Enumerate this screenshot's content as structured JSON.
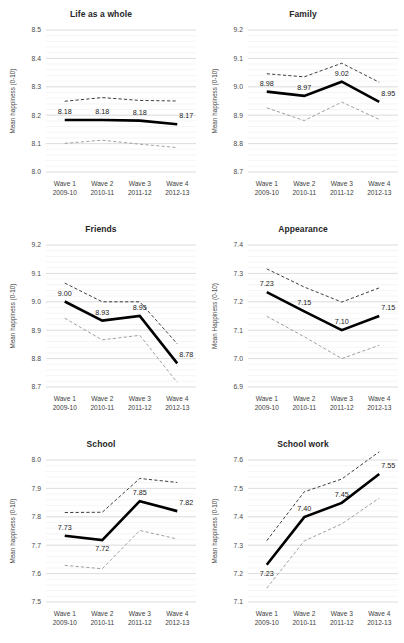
{
  "figure": {
    "axis_y_title": "Mean happiness (0-10)",
    "categories": [
      "Wave 1",
      "Wave 2",
      "Wave 3",
      "Wave 4"
    ],
    "category_years": [
      "2009-10",
      "2010-11",
      "2011-12",
      "2012-13"
    ],
    "colors": {
      "mean_line": "#000000",
      "ci_upper": "#1c1c1c",
      "ci_lower": "#8f8f8f",
      "gridline": "#d4d4d4",
      "background": "#ffffff"
    }
  },
  "chart_data": [
    {
      "type": "line",
      "title": "Life as a whole",
      "xlabel": "",
      "ylabel": "Mean happiness (0-10)",
      "categories": [
        "Wave 1",
        "Wave 2",
        "Wave 3",
        "Wave 4"
      ],
      "category_years": [
        "2009-10",
        "2010-11",
        "2011-12",
        "2012-13"
      ],
      "ylim": [
        8.0,
        8.5
      ],
      "yticks": [
        8.0,
        8.1,
        8.2,
        8.3,
        8.4,
        8.5
      ],
      "ytick_labels": [
        "8.0",
        "8.1",
        "8.2",
        "8.3",
        "8.4",
        "8.5"
      ],
      "minor_tick_step": 0.02,
      "grid": true,
      "legend": "none",
      "series": [
        {
          "name": "Mean",
          "values": [
            8.183,
            8.183,
            8.181,
            8.168
          ],
          "style": "solid-thick"
        },
        {
          "name": "Upper 95% CI",
          "values": [
            8.249,
            8.262,
            8.252,
            8.25
          ],
          "style": "dashed-dark"
        },
        {
          "name": "Lower 95% CI",
          "values": [
            8.101,
            8.112,
            8.098,
            8.086
          ],
          "style": "dashed-light"
        }
      ],
      "data_labels": [
        "8.18",
        "8.18",
        "8.18",
        "8.17"
      ],
      "label_positions": [
        "above",
        "above",
        "above",
        "above-right"
      ]
    },
    {
      "type": "line",
      "title": "Family",
      "xlabel": "",
      "ylabel": "Mean happiness (0-10)",
      "categories": [
        "Wave 1",
        "Wave 2",
        "Wave 3",
        "Wave 4"
      ],
      "category_years": [
        "2009-10",
        "2010-11",
        "2011-12",
        "2012-13"
      ],
      "ylim": [
        8.7,
        9.2
      ],
      "yticks": [
        8.7,
        8.8,
        8.9,
        9.0,
        9.1,
        9.2
      ],
      "ytick_labels": [
        "8.7",
        "8.8",
        "8.9",
        "9.0",
        "9.1",
        "9.2"
      ],
      "minor_tick_step": 0.02,
      "grid": true,
      "legend": "none",
      "series": [
        {
          "name": "Mean",
          "values": [
            8.983,
            8.968,
            9.018,
            8.947
          ],
          "style": "solid-thick"
        },
        {
          "name": "Upper 95% CI",
          "values": [
            9.046,
            9.035,
            9.083,
            9.016
          ],
          "style": "dashed-dark"
        },
        {
          "name": "Lower 95% CI",
          "values": [
            8.926,
            8.881,
            8.946,
            8.885
          ],
          "style": "dashed-light"
        }
      ],
      "data_labels": [
        "8.98",
        "8.97",
        "9.02",
        "8.95"
      ],
      "label_positions": [
        "above",
        "above",
        "above",
        "above-right"
      ]
    },
    {
      "type": "line",
      "title": "Friends",
      "xlabel": "",
      "ylabel": "Mean happiness (0-10)",
      "categories": [
        "Wave 1",
        "Wave 2",
        "Wave 3",
        "Wave 4"
      ],
      "category_years": [
        "2009-10",
        "2010-11",
        "2011-12",
        "2012-13"
      ],
      "ylim": [
        8.7,
        9.2
      ],
      "yticks": [
        8.7,
        8.8,
        8.9,
        9.0,
        9.1,
        9.2
      ],
      "ytick_labels": [
        "8.7",
        "8.8",
        "8.9",
        "9.0",
        "9.1",
        "9.2"
      ],
      "minor_tick_step": 0.02,
      "grid": true,
      "legend": "none",
      "series": [
        {
          "name": "Mean",
          "values": [
            9.001,
            8.934,
            8.95,
            8.783
          ],
          "style": "solid-thick"
        },
        {
          "name": "Upper 95% CI",
          "values": [
            9.066,
            9.0,
            9.0,
            8.852
          ],
          "style": "dashed-dark"
        },
        {
          "name": "Lower 95% CI",
          "values": [
            8.942,
            8.866,
            8.882,
            8.716
          ],
          "style": "dashed-light"
        }
      ],
      "data_labels": [
        "9.00",
        "8.93",
        "8.95",
        "8.78"
      ],
      "label_positions": [
        "above",
        "above",
        "above",
        "above-right"
      ]
    },
    {
      "type": "line",
      "title": "Appearance",
      "xlabel": "",
      "ylabel": "Mean Happiness (0-10)",
      "categories": [
        "Wave 1",
        "Wave 2",
        "Wave 3",
        "Wave 4"
      ],
      "category_years": [
        "2009-10",
        "2010-11",
        "2011-12",
        "2012-13"
      ],
      "ylim": [
        6.9,
        7.4
      ],
      "yticks": [
        6.9,
        7.0,
        7.1,
        7.2,
        7.3,
        7.4
      ],
      "ytick_labels": [
        "6.9",
        "7.0",
        "7.1",
        "7.2",
        "7.3",
        "7.4"
      ],
      "minor_tick_step": 0.02,
      "grid": true,
      "legend": "none",
      "series": [
        {
          "name": "Mean",
          "values": [
            7.234,
            7.166,
            7.1,
            7.15
          ],
          "style": "solid-thick"
        },
        {
          "name": "Upper 95% CI",
          "values": [
            7.316,
            7.252,
            7.199,
            7.249
          ],
          "style": "dashed-dark"
        },
        {
          "name": "Lower 95% CI",
          "values": [
            7.149,
            7.077,
            7.0,
            7.047
          ],
          "style": "dashed-light"
        }
      ],
      "data_labels": [
        "7.23",
        "7.15",
        "7.10",
        "7.15"
      ],
      "label_positions": [
        "above",
        "above",
        "above",
        "above-right"
      ]
    },
    {
      "type": "line",
      "title": "School",
      "xlabel": "",
      "ylabel": "Mean happiness (0-10)",
      "categories": [
        "Wave 1",
        "Wave 2",
        "Wave 3",
        "Wave 4"
      ],
      "category_years": [
        "2009-10",
        "2010-11",
        "2011-12",
        "2012-13"
      ],
      "ylim": [
        7.5,
        8.0
      ],
      "yticks": [
        7.5,
        7.6,
        7.7,
        7.8,
        7.9,
        8.0
      ],
      "ytick_labels": [
        "7.5",
        "7.6",
        "7.7",
        "7.8",
        "7.9",
        "8.0"
      ],
      "minor_tick_step": 0.02,
      "grid": true,
      "legend": "none",
      "series": [
        {
          "name": "Mean",
          "values": [
            7.733,
            7.718,
            7.855,
            7.82
          ],
          "style": "solid-thick"
        },
        {
          "name": "Upper 95% CI",
          "values": [
            7.815,
            7.816,
            7.935,
            7.921
          ],
          "style": "dashed-dark"
        },
        {
          "name": "Lower 95% CI",
          "values": [
            7.629,
            7.617,
            7.752,
            7.722
          ],
          "style": "dashed-light"
        }
      ],
      "data_labels": [
        "7.73",
        "7.72",
        "7.85",
        "7.82"
      ],
      "label_positions": [
        "above",
        "below",
        "above",
        "above-right"
      ]
    },
    {
      "type": "line",
      "title": "School work",
      "xlabel": "",
      "ylabel": "Mean happiness (0-10)",
      "categories": [
        "Wave 1",
        "Wave 2",
        "Wave 3",
        "Wave 4"
      ],
      "category_years": [
        "2009-10",
        "2010-11",
        "2011-12",
        "2012-13"
      ],
      "ylim": [
        7.1,
        7.6
      ],
      "yticks": [
        7.1,
        7.2,
        7.3,
        7.4,
        7.5,
        7.6
      ],
      "ytick_labels": [
        "7.1",
        "7.2",
        "7.3",
        "7.4",
        "7.5",
        "7.6"
      ],
      "minor_tick_step": 0.02,
      "grid": true,
      "legend": "none",
      "series": [
        {
          "name": "Mean",
          "values": [
            7.231,
            7.399,
            7.449,
            7.551
          ],
          "style": "solid-thick"
        },
        {
          "name": "Upper 95% CI",
          "values": [
            7.316,
            7.488,
            7.533,
            7.629
          ],
          "style": "dashed-dark"
        },
        {
          "name": "Lower 95% CI",
          "values": [
            7.149,
            7.315,
            7.375,
            7.466
          ],
          "style": "dashed-light"
        }
      ],
      "data_labels": [
        "7.23",
        "7.40",
        "7.45",
        "7.55"
      ],
      "label_positions": [
        "below",
        "above",
        "above",
        "above-right"
      ]
    }
  ]
}
